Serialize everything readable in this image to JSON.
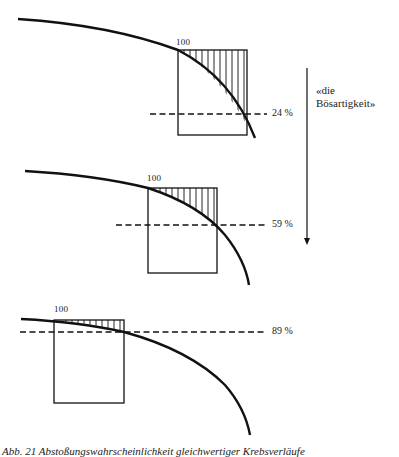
{
  "diagram": {
    "side_label_line1": "«die",
    "side_label_line2": "Bösartigkeit»",
    "panels": [
      {
        "start_label": "100",
        "percent_label": "24 %",
        "percent": 24
      },
      {
        "start_label": "100",
        "percent_label": "59 %",
        "percent": 59
      },
      {
        "start_label": "100",
        "percent_label": "89 %",
        "percent": 89
      }
    ],
    "caption": "Abb. 21 Abstoßungswahrscheinlichkeit gleichwertiger Krebsverläufe"
  },
  "colors": {
    "ink": "#111111",
    "background": "#ffffff"
  }
}
